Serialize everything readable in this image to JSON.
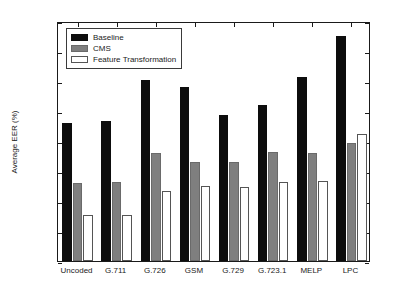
{
  "chart_data": {
    "type": "bar",
    "title": "",
    "xlabel": "",
    "ylabel": "Average EER (%)",
    "ylim": [
      0,
      16
    ],
    "ytick_labels": [
      "0",
      "2",
      "4",
      "6",
      "8",
      "10",
      "12",
      "14",
      "16"
    ],
    "yticks": [
      0,
      2,
      4,
      6,
      8,
      10,
      12,
      14,
      16
    ],
    "grid": false,
    "legend_position": "upper-left",
    "categories": [
      "Uncoded",
      "G.711",
      "G.726",
      "GSM",
      "G.729",
      "G.723.1",
      "MELP",
      "LPC"
    ],
    "series": [
      {
        "name": "Baseline",
        "color": "#0d0d0d",
        "values": [
          9.2,
          9.35,
          12.1,
          11.6,
          9.75,
          10.4,
          12.3,
          15.0
        ]
      },
      {
        "name": "CMS",
        "color": "#7f7f7f",
        "values": [
          5.2,
          5.3,
          7.2,
          6.6,
          6.6,
          7.3,
          7.2,
          7.9
        ]
      },
      {
        "name": "Feature Transformation",
        "color": "#ffffff",
        "values": [
          3.05,
          3.05,
          4.65,
          5.0,
          4.95,
          5.3,
          5.35,
          8.5
        ]
      }
    ]
  },
  "figure": {
    "background": "#ffffff",
    "axis_color": "#1a1a1a"
  }
}
